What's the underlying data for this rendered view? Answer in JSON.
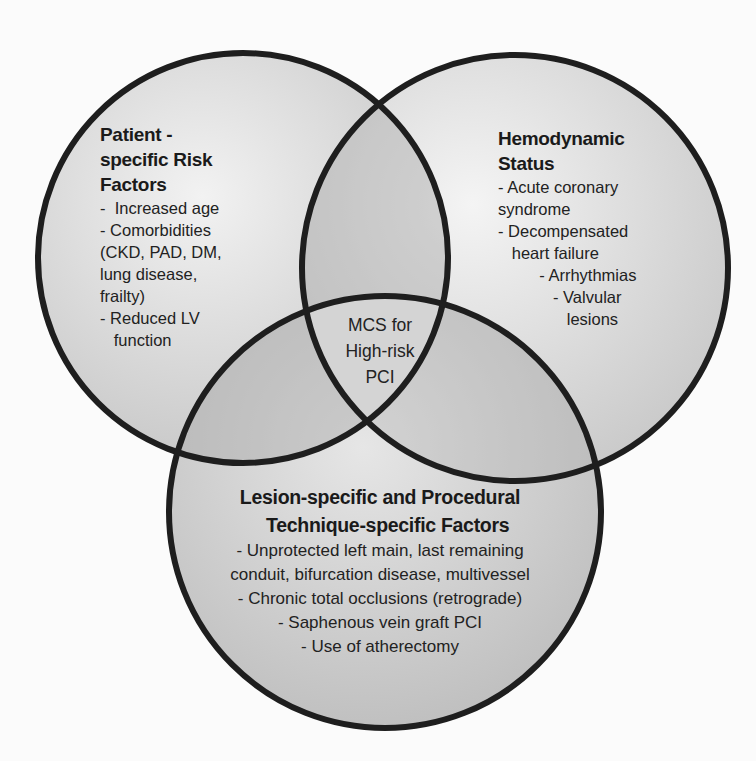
{
  "diagram": {
    "type": "venn-3",
    "colors": {
      "background": "#fbfbfb",
      "circle_fill": "#c8c8c8",
      "circle_stroke": "#1e1e1e"
    },
    "circles": [
      {
        "id": "left",
        "title_lines": [
          "Patient -",
          "specific Risk",
          "Factors"
        ],
        "items": [
          "-  Increased age",
          "- Comorbidities",
          "(CKD, PAD, DM,",
          "lung disease,",
          "frailty)",
          "- Reduced LV",
          "   function"
        ]
      },
      {
        "id": "right",
        "title_lines": [
          "Hemodynamic",
          "Status"
        ],
        "items": [
          "- Acute coronary",
          "syndrome",
          "- Decompensated",
          "   heart failure",
          "         - Arrhythmias",
          "            - Valvular",
          "               lesions"
        ]
      },
      {
        "id": "bottom",
        "title_lines": [
          "Lesion-specific and Procedural",
          "   Technique-specific Factors"
        ],
        "items": [
          "- Unprotected left main, last remaining",
          "conduit, bifurcation disease, multivessel",
          "- Chronic total occlusions (retrograde)",
          "- Saphenous vein graft PCI",
          "- Use of atherectomy"
        ]
      }
    ],
    "center": {
      "lines": [
        "MCS for",
        "High-risk",
        "PCI"
      ]
    }
  }
}
